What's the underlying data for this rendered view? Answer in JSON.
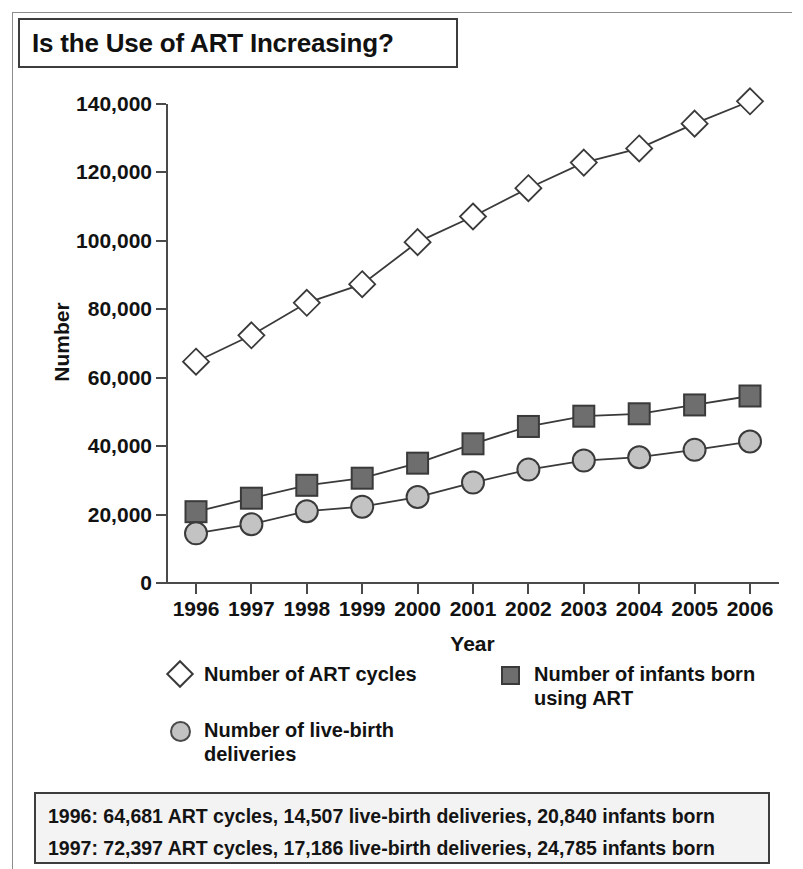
{
  "title": "Is the Use of ART Increasing?",
  "axes": {
    "ylabel": "Number",
    "xlabel": "Year",
    "y_ticks": [
      "0",
      "20,000",
      "40,000",
      "60,000",
      "80,000",
      "100,000",
      "120,000",
      "140,000"
    ],
    "x_ticks": [
      "1996",
      "1997",
      "1998",
      "1999",
      "2000",
      "2001",
      "2002",
      "2003",
      "2004",
      "2005",
      "2006"
    ]
  },
  "legend": {
    "art_cycles": "Number of ART cycles",
    "infants": "Number of infants born\nusing ART",
    "live_births": "Number of live-birth\ndeliveries",
    "marker_art": "open-diamond-marker",
    "marker_infants": "filled-square-marker",
    "marker_births": "filled-circle-marker"
  },
  "footnote": {
    "line1": "1996: 64,681 ART cycles, 14,507 live-birth deliveries, 20,840 infants born",
    "line2": "1997: 72,397 ART cycles, 17,186 live-birth deliveries, 24,785 infants born"
  },
  "colors": {
    "art_cycles_fill": "#ffffff",
    "infants_fill": "#6e6e6e",
    "live_births_fill": "#c3c3c3",
    "stroke": "#3a3a3a",
    "axis": "#4a4a4a",
    "footnote_bg": "#f3f3f3"
  },
  "chart_data": {
    "type": "line",
    "title": "Is the Use of ART Increasing?",
    "xlabel": "Year",
    "ylabel": "Number",
    "categories": [
      1996,
      1997,
      1998,
      1999,
      2000,
      2001,
      2002,
      2003,
      2004,
      2005,
      2006
    ],
    "ylim": [
      0,
      140000
    ],
    "ytick_step": 20000,
    "grid": false,
    "legend_position": "below-axes",
    "series": [
      {
        "name": "Number of ART cycles",
        "marker": "diamond",
        "fill": "#ffffff",
        "values": [
          64681,
          72397,
          81899,
          87340,
          99629,
          107122,
          115392,
          122872,
          127023,
          134260,
          140795
        ]
      },
      {
        "name": "Number of infants born using ART",
        "marker": "square",
        "fill": "#6e6e6e",
        "values": [
          20840,
          24785,
          28553,
          30629,
          35025,
          40687,
          45751,
          48756,
          49458,
          52041,
          54656
        ]
      },
      {
        "name": "Number of live-birth deliveries",
        "marker": "circle",
        "fill": "#c3c3c3",
        "values": [
          14507,
          17186,
          20986,
          22307,
          25121,
          29344,
          33141,
          35785,
          36760,
          38910,
          41343
        ]
      }
    ]
  }
}
